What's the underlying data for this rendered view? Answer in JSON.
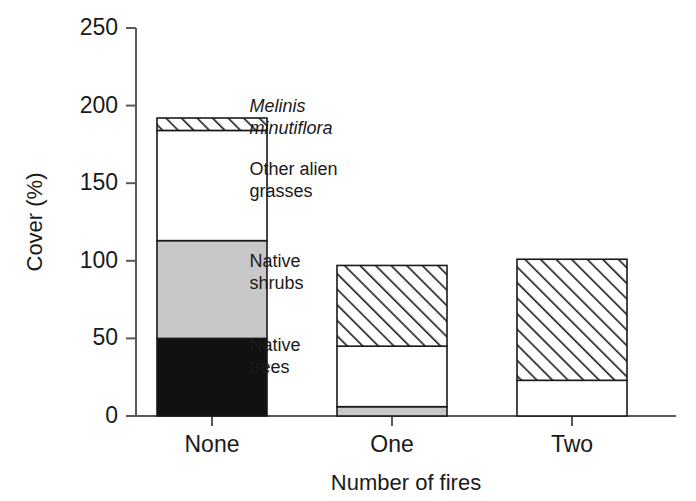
{
  "chart_data": {
    "type": "bar",
    "subtype": "stacked-bar",
    "title": "",
    "xlabel": "Number of fires",
    "ylabel": "Cover (%)",
    "categories": [
      "None",
      "One",
      "Two"
    ],
    "ylim": [
      0,
      250
    ],
    "yticks": [
      0,
      50,
      100,
      150,
      200,
      250
    ],
    "ytick_labels": [
      "0",
      "50",
      "100",
      "150",
      "200",
      "250"
    ],
    "grid": false,
    "legend_position": "inside-plot-left",
    "series": [
      {
        "name": "Native trees",
        "fill": "#111111",
        "pattern": "solid-black",
        "values": [
          50,
          0,
          0
        ]
      },
      {
        "name": "Native shrubs",
        "fill": "#c8c8c8",
        "pattern": "solid-grey",
        "values": [
          63,
          6,
          0
        ]
      },
      {
        "name": "Other alien grasses",
        "fill": "#ffffff",
        "pattern": "solid-white",
        "values": [
          71,
          39,
          23
        ]
      },
      {
        "name": "Melinis minutiflora",
        "fill": "#ffffff",
        "pattern": "diagonal-hatch",
        "values": [
          8,
          52,
          78
        ]
      }
    ],
    "totals": [
      192,
      97,
      101
    ],
    "annotations": [
      {
        "text": "Melinis",
        "italic": true,
        "x_pct": 21.0,
        "y_value": 196
      },
      {
        "text": "minutiflora",
        "italic": true,
        "x_pct": 21.0,
        "y_value": 182
      },
      {
        "text": "Other alien",
        "italic": false,
        "x_pct": 21.0,
        "y_value": 155
      },
      {
        "text": "grasses",
        "italic": false,
        "x_pct": 21.0,
        "y_value": 141
      },
      {
        "text": "Native",
        "italic": false,
        "x_pct": 21.0,
        "y_value": 96
      },
      {
        "text": "shrubs",
        "italic": false,
        "x_pct": 21.0,
        "y_value": 82
      },
      {
        "text": "Native",
        "italic": false,
        "x_pct": 21.0,
        "y_value": 42
      },
      {
        "text": "trees",
        "italic": false,
        "x_pct": 21.0,
        "y_value": 28
      }
    ]
  },
  "colors": {
    "native_trees": "#111111",
    "native_shrubs": "#c8c8c8",
    "other_alien_grasses": "#ffffff",
    "melinis_minutiflora": "#ffffff",
    "outline": "#1a1a1a",
    "axis": "#595959",
    "background": "#ffffff"
  },
  "axis": {
    "y_title": "Cover (%)",
    "x_title": "Number of fires"
  }
}
